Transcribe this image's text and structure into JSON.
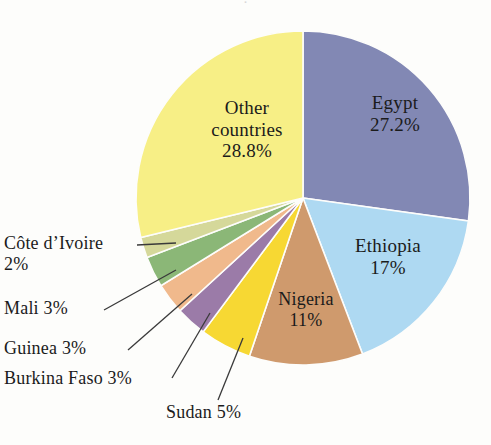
{
  "figure": {
    "background_color": "#fdfdfb",
    "text_color": "#1b1b1b",
    "leader_line_color": "#3a3a3a",
    "cropped_title_fragment": "·"
  },
  "chart_data": {
    "type": "pie",
    "title": "",
    "xlabel": "",
    "ylabel": "",
    "legend_position": "none",
    "grid": false,
    "start_angle_deg": 0,
    "direction": "clockwise",
    "center": {
      "x": 303,
      "y": 198
    },
    "radius": 167,
    "categories": [
      "Egypt",
      "Ethiopia",
      "Nigeria",
      "Sudan",
      "Burkina Faso",
      "Guinea",
      "Mali",
      "Côte d’Ivoire",
      "Other countries"
    ],
    "values": [
      27.2,
      17,
      11,
      5,
      3,
      3,
      3,
      2,
      28.8
    ],
    "value_labels": [
      "27.2%",
      "17%",
      "11%",
      "5%",
      "3%",
      "3%",
      "3%",
      "2%",
      "28.8%"
    ],
    "colors": [
      "#8288b4",
      "#aed9f2",
      "#cf9a6d",
      "#f7d833",
      "#9b7ba8",
      "#f0b98c",
      "#8bb777",
      "#d5d89a",
      "#f7ef86"
    ],
    "slices": [
      {
        "name": "Egypt",
        "value": 27.2,
        "color": "#8288b4",
        "label_text": "Egypt\n27.2%",
        "label_placement": "inside"
      },
      {
        "name": "Ethiopia",
        "value": 17,
        "color": "#aed9f2",
        "label_text": "Ethiopia\n17%",
        "label_placement": "inside"
      },
      {
        "name": "Nigeria",
        "value": 11,
        "color": "#cf9a6d",
        "label_text": "Nigeria\n11%",
        "label_placement": "inside"
      },
      {
        "name": "Sudan",
        "value": 5,
        "color": "#f7d833",
        "label_text": "Sudan 5%",
        "label_placement": "callout"
      },
      {
        "name": "Burkina Faso",
        "value": 3,
        "color": "#9b7ba8",
        "label_text": "Burkina Faso 3%",
        "label_placement": "callout"
      },
      {
        "name": "Guinea",
        "value": 3,
        "color": "#f0b98c",
        "label_text": "Guinea 3%",
        "label_placement": "callout"
      },
      {
        "name": "Mali",
        "value": 3,
        "color": "#8bb777",
        "label_text": "Mali 3%",
        "label_placement": "callout"
      },
      {
        "name": "Côte d’Ivoire",
        "value": 2,
        "color": "#d5d89a",
        "label_text": "Côte d’Ivoire\n2%",
        "label_placement": "callout"
      },
      {
        "name": "Other countries",
        "value": 28.8,
        "color": "#f7ef86",
        "label_text": "Other\ncountries\n28.8%",
        "label_placement": "inside"
      }
    ]
  },
  "labels": {
    "egypt": "Egypt\n27.2%",
    "ethiopia": "Ethiopia\n17%",
    "nigeria": "Nigeria\n11%",
    "other_countries": "Other\ncountries\n28.8%",
    "cote_divoire": "Côte d’Ivoire\n2%",
    "mali": "Mali 3%",
    "guinea": "Guinea 3%",
    "burkina_faso": "Burkina Faso 3%",
    "sudan": "Sudan 5%"
  }
}
